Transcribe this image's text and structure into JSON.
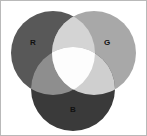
{
  "figure": {
    "kind": "venn-diagram",
    "background_color": "#ffffff",
    "border_color": "#b9b9b9"
  },
  "chart_data": {
    "type": "venn",
    "title": "",
    "sets": [
      {
        "key": "R",
        "label": "R",
        "name": "Red channel",
        "color": "#585858",
        "center_x": 53,
        "center_y": 53,
        "radius": 42,
        "label_x": 33,
        "label_y": 43
      },
      {
        "key": "G",
        "label": "G",
        "name": "Green channel",
        "color": "#a8a8a8",
        "center_x": 94,
        "center_y": 53,
        "radius": 42,
        "label_x": 107,
        "label_y": 43
      },
      {
        "key": "B",
        "label": "B",
        "name": "Blue channel",
        "color": "#3a3a3a",
        "center_x": 73,
        "center_y": 89,
        "radius": 42,
        "label_x": 73,
        "label_y": 110
      }
    ],
    "intersections": [
      {
        "key": "RG",
        "sets": [
          "R",
          "G"
        ],
        "label": "",
        "color": "#d4d4d4"
      },
      {
        "key": "RB",
        "sets": [
          "R",
          "B"
        ],
        "label": "",
        "color": "#8e8e8e"
      },
      {
        "key": "GB",
        "sets": [
          "G",
          "B"
        ],
        "label": "",
        "color": "#cfcfcf"
      },
      {
        "key": "RGB",
        "sets": [
          "R",
          "G",
          "B"
        ],
        "label": "",
        "color": "#fdfdfd"
      }
    ],
    "legend_position": "none",
    "grid": false
  }
}
